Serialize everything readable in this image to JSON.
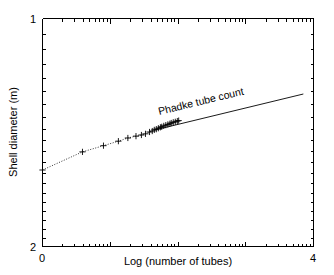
{
  "chart_data": {
    "type": "line",
    "title": "",
    "xlabel": "Log (number of tubes)",
    "ylabel": "Shell diameter (m)",
    "xlim": [
      0,
      4
    ],
    "ylim": [
      2,
      1
    ],
    "y_axis_inverted": true,
    "y_scale": "log",
    "x_tick_labels": [
      "0",
      "4"
    ],
    "x_tick_values": [
      0,
      4
    ],
    "y_tick_labels": [
      "1",
      "2"
    ],
    "y_tick_values": [
      1,
      2
    ],
    "grid": false,
    "legend": "none",
    "annotations": [
      {
        "text": "Phadke tube count",
        "rotation_deg": -19,
        "x": 2.35,
        "y": 1.3
      }
    ],
    "series": [
      {
        "name": "Phadke tube count",
        "marker": "+",
        "linestyle": "dotted",
        "x": [
          0.0,
          0.59,
          0.9,
          1.12,
          1.26,
          1.38,
          1.46,
          1.52,
          1.58,
          1.62,
          1.65,
          1.68,
          1.71,
          1.74,
          1.76,
          1.79,
          1.82,
          1.85,
          1.88,
          1.9,
          1.93,
          1.96,
          1.99,
          2.01
        ],
        "y": [
          1.585,
          1.5,
          1.472,
          1.452,
          1.438,
          1.43,
          1.425,
          1.42,
          1.412,
          1.408,
          1.403,
          1.4,
          1.396,
          1.392,
          1.39,
          1.386,
          1.383,
          1.38,
          1.377,
          1.374,
          1.371,
          1.369,
          1.366,
          1.364
        ]
      },
      {
        "name": "Phadke tube count fit",
        "marker": "none",
        "linestyle": "solid",
        "x": [
          1.65,
          3.85
        ],
        "y": [
          1.404,
          1.258
        ]
      }
    ]
  },
  "axes": {
    "x_left_label": "0",
    "x_right_label": "4",
    "y_top_label": "1",
    "y_bottom_label": "2",
    "x_axis_title": "Log (number of tubes)",
    "y_axis_title": "Shell diameter (m)"
  },
  "colors": {
    "foreground": "#000000",
    "background": "#ffffff"
  }
}
